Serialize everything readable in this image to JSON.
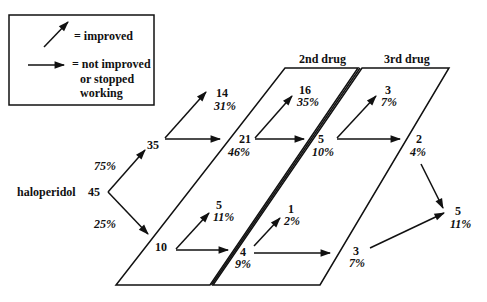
{
  "legend": {
    "improved_label": "= improved",
    "not_improved_line1": "= not improved",
    "not_improved_line2": "or stopped",
    "not_improved_line3": "working"
  },
  "panels": {
    "second_drug": "2nd drug",
    "third_drug": "3rd drug"
  },
  "start": {
    "drug": "haloperidol",
    "n": "45"
  },
  "nodes": {
    "n35": {
      "n": "35",
      "pct": "75%"
    },
    "n10": {
      "n": "10",
      "pct": "25%"
    },
    "n14": {
      "n": "14",
      "pct": "31%"
    },
    "n21": {
      "n": "21",
      "pct": "46%"
    },
    "n5a": {
      "n": "5",
      "pct": "11%"
    },
    "n4": {
      "n": "4",
      "pct": "9%"
    },
    "n16": {
      "n": "16",
      "pct": "35%"
    },
    "n5b": {
      "n": "5",
      "pct": "10%"
    },
    "n1": {
      "n": "1",
      "pct": "2%"
    },
    "n3a": {
      "n": "3",
      "pct": "7%"
    },
    "n3b": {
      "n": "3",
      "pct": "7%"
    },
    "n2": {
      "n": "2",
      "pct": "4%"
    },
    "n5c": {
      "n": "5",
      "pct": "11%"
    }
  },
  "colors": {
    "ink": "#111111",
    "background": "#ffffff"
  }
}
